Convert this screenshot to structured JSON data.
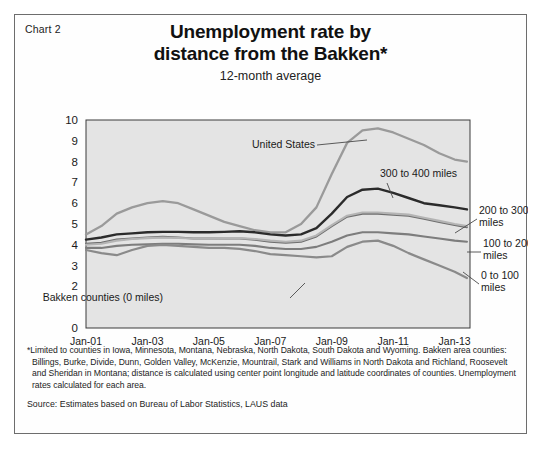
{
  "chart_label": "Chart 2",
  "title_line1": "Unemployment rate by",
  "title_line2": "distance from the Bakken*",
  "subtitle": "12-month average",
  "footnote_1": "*Limited to counties in Iowa, Minnesota, Montana, Nebraska, North Dakota, South Dakota and Wyoming. Bakken area counties: Billings, Burke, Divide, Dunn, Golden Valley, McKenzie, Mountrail, Stark and Williams in North Dakota and Richland, Roosevelt and Sheridan in Montana; distance is calculated using center point longitude and latitude coordinates of counties. Unemployment rates calculated for each area.",
  "source": "Source: Estimates based on Bureau of Labor Statistics, LAUS data",
  "chart_data": {
    "type": "line",
    "title": "Unemployment rate by distance from the Bakken*",
    "subtitle": "12-month average",
    "xlabel": "",
    "ylabel": "",
    "grid": false,
    "legend_position": "inline-annotations",
    "xlim": [
      2001,
      2013.5
    ],
    "ylim": [
      0,
      10
    ],
    "yticks": [
      0,
      2,
      3,
      4,
      5,
      6,
      7,
      8,
      9,
      10
    ],
    "ytick_labels": [
      "0",
      "2",
      "3",
      "4",
      "5",
      "6",
      "7",
      "8",
      "9",
      "10"
    ],
    "xticks": [
      2001,
      2003,
      2005,
      2007,
      2009,
      2011,
      2013
    ],
    "xtick_labels": [
      "Jan-01",
      "Jan-03",
      "Jan-05",
      "Jan-07",
      "Jan-09",
      "Jan-11",
      "Jan-13"
    ],
    "x": [
      2001.0,
      2001.5,
      2002.0,
      2002.5,
      2003.0,
      2003.5,
      2004.0,
      2004.5,
      2005.0,
      2005.5,
      2006.0,
      2006.5,
      2007.0,
      2007.5,
      2008.0,
      2008.5,
      2009.0,
      2009.5,
      2010.0,
      2010.5,
      2011.0,
      2011.5,
      2012.0,
      2012.5,
      2013.0,
      2013.4
    ],
    "series": [
      {
        "name": "United States",
        "color": "#9a9a9a",
        "width": 2.3,
        "label": "United States",
        "values": [
          4.5,
          4.9,
          5.5,
          5.8,
          6.0,
          6.1,
          6.0,
          5.7,
          5.4,
          5.1,
          4.9,
          4.7,
          4.6,
          4.6,
          5.0,
          5.8,
          7.4,
          8.9,
          9.5,
          9.6,
          9.4,
          9.1,
          8.8,
          8.4,
          8.1,
          8.0
        ]
      },
      {
        "name": "300 to 400 miles",
        "color": "#2b2b2b",
        "width": 2.4,
        "label": "300 to 400 miles",
        "values": [
          4.25,
          4.35,
          4.5,
          4.55,
          4.6,
          4.62,
          4.62,
          4.6,
          4.6,
          4.62,
          4.65,
          4.6,
          4.5,
          4.45,
          4.5,
          4.8,
          5.5,
          6.3,
          6.65,
          6.7,
          6.5,
          6.25,
          6.0,
          5.9,
          5.8,
          5.7
        ]
      },
      {
        "name": "200 to 300 miles",
        "color": "#6e6e6e",
        "width": 2.1,
        "label": "200 to 300 miles",
        "values": [
          4.05,
          4.1,
          4.25,
          4.3,
          4.35,
          4.38,
          4.35,
          4.3,
          4.3,
          4.3,
          4.3,
          4.25,
          4.15,
          4.1,
          4.15,
          4.4,
          4.9,
          5.35,
          5.5,
          5.5,
          5.45,
          5.4,
          5.25,
          5.1,
          4.95,
          4.85
        ]
      },
      {
        "name": "100 to 200 miles",
        "color": "#b4b4b4",
        "width": 2.1,
        "label": "100 to 200 miles",
        "values": [
          4.0,
          4.05,
          4.2,
          4.28,
          4.32,
          4.35,
          4.33,
          4.3,
          4.3,
          4.32,
          4.32,
          4.28,
          4.2,
          4.15,
          4.2,
          4.45,
          4.95,
          5.4,
          5.55,
          5.55,
          5.5,
          5.45,
          5.3,
          5.15,
          5.0,
          4.9
        ]
      },
      {
        "name": "0 to 100 miles",
        "color": "#7d7d7d",
        "width": 2.1,
        "label": "0 to 100 miles",
        "values": [
          3.85,
          3.85,
          3.95,
          4.0,
          4.02,
          4.05,
          4.05,
          4.02,
          4.0,
          4.0,
          4.0,
          3.95,
          3.85,
          3.8,
          3.8,
          3.9,
          4.15,
          4.45,
          4.6,
          4.6,
          4.55,
          4.5,
          4.4,
          4.3,
          4.2,
          4.15
        ]
      },
      {
        "name": "Bakken counties (0 miles)",
        "color": "#8a8a8a",
        "width": 2.2,
        "label": "Bakken counties (0 miles)",
        "values": [
          3.75,
          3.6,
          3.5,
          3.75,
          3.95,
          4.0,
          3.95,
          3.9,
          3.85,
          3.85,
          3.8,
          3.7,
          3.55,
          3.5,
          3.45,
          3.4,
          3.45,
          3.9,
          4.15,
          4.2,
          3.95,
          3.6,
          3.3,
          3.0,
          2.7,
          2.4
        ]
      }
    ],
    "annotations": [
      {
        "text": "United States",
        "x": 300,
        "y": 133
      },
      {
        "text": "300 to 400 miles",
        "x": 365,
        "y": 162
      },
      {
        "text": "Bakken counties (0 miles)",
        "x": 148,
        "y": 286
      },
      {
        "text": "200 to 300",
        "x": 464,
        "y": 199
      },
      {
        "text": "miles",
        "x": 464,
        "y": 211
      },
      {
        "text": "100 to 200",
        "x": 468,
        "y": 232
      },
      {
        "text": "miles",
        "x": 468,
        "y": 244
      },
      {
        "text": "0 to 100",
        "x": 466,
        "y": 264
      },
      {
        "text": "miles",
        "x": 466,
        "y": 276
      }
    ]
  }
}
